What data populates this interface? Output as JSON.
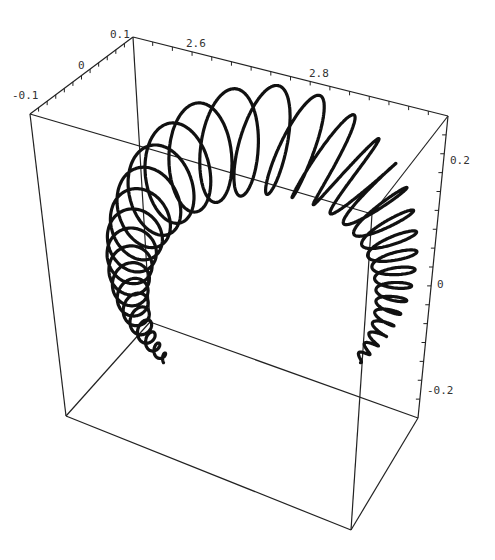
{
  "chart_data": {
    "type": "line3d",
    "title": "",
    "axes": {
      "depth_axis": {
        "ticks": [
          -0.1,
          0,
          0.1
        ],
        "labels": [
          "-0.1",
          "0",
          "0.1"
        ]
      },
      "x_axis": {
        "ticks": [
          2.6,
          2.8
        ],
        "labels": [
          "2.6",
          "2.8"
        ]
      },
      "z_axis": {
        "ticks": [
          0.2,
          0,
          -0.2
        ],
        "labels": [
          "0.2",
          "0",
          "-0.2"
        ]
      }
    },
    "grid": false,
    "legend": null,
    "curve": {
      "turns": 34,
      "arc_center": [
        262,
        280
      ],
      "arc_start_deg": -30,
      "arc_end_deg": 210,
      "arc_radius_start": 140,
      "arc_radius_end": 150,
      "coil_radius_start": 18,
      "coil_radius_end": 72,
      "dense_end_top": [
        385,
        258
      ],
      "dense_end_bottom": [
        380,
        385
      ],
      "color": "#111111"
    }
  },
  "box": {
    "vertices": {
      "back_top_left": [
        133,
        37
      ],
      "back_top_right": [
        448,
        116
      ],
      "front_top_left": [
        30,
        114
      ],
      "front_top_right": [
        372,
        214
      ],
      "back_bottom_left": [
        150,
        322
      ],
      "back_bottom_right": [
        418,
        418
      ],
      "front_bottom_left": [
        66,
        416
      ],
      "front_bottom_right": [
        351,
        530
      ]
    }
  },
  "labels": {
    "depth": [
      {
        "text": "-0.1",
        "x": 12,
        "y": 99
      },
      {
        "text": "0",
        "x": 78,
        "y": 69
      },
      {
        "text": "0.1",
        "x": 110,
        "y": 38
      }
    ],
    "xaxis": [
      {
        "text": "2.6",
        "x": 186,
        "y": 47
      },
      {
        "text": "2.8",
        "x": 309,
        "y": 77
      }
    ],
    "zaxis": [
      {
        "text": "0.2",
        "x": 450,
        "y": 164
      },
      {
        "text": "0",
        "x": 437,
        "y": 288
      },
      {
        "text": "-0.2",
        "x": 427,
        "y": 394
      }
    ]
  }
}
